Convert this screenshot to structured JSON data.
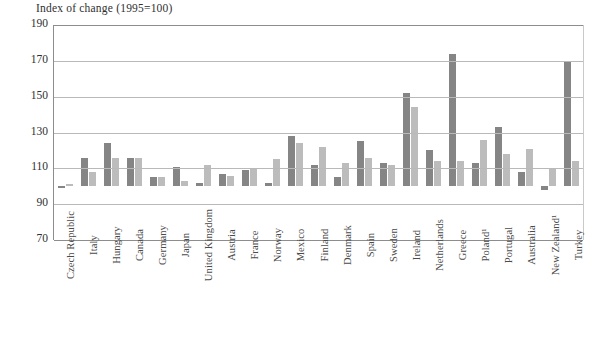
{
  "header": {
    "cropped_top_text": ""
  },
  "axis": {
    "y_title": "Index of change (1995=100)",
    "y_ticks": [
      190,
      170,
      150,
      130,
      110,
      90,
      70
    ]
  },
  "colors": {
    "series_1": "#858585",
    "series_2": "#bcbcbc",
    "gridline": "#b9b9b9",
    "axis": "#8d8d8d"
  },
  "chart_data": {
    "type": "bar",
    "title": "",
    "subtitle": "",
    "xlabel": "",
    "ylabel": "Index of change (1995=100)",
    "ylim": [
      70,
      190
    ],
    "baseline": 100,
    "grid": true,
    "legend_position": "none",
    "categories": [
      "Czech Republic",
      "Italy",
      "Hungary",
      "Canada",
      "Germany",
      "Japan",
      "United Kingdom",
      "Austria",
      "France",
      "Norway",
      "Mexico",
      "Finland",
      "Denmark",
      "Spain",
      "Sweden",
      "Ireland",
      "Netherlands",
      "Greece",
      "Poland¹",
      "Portugal",
      "Australia",
      "New Zealand¹",
      "Turkey"
    ],
    "series": [
      {
        "name": "series-1",
        "color": "#858585",
        "values": [
          100,
          116,
          124,
          116,
          105,
          111,
          102,
          107,
          109,
          102,
          128,
          112,
          105,
          125,
          113,
          152,
          120,
          174,
          113,
          133,
          108,
          98,
          170
        ]
      },
      {
        "name": "series-2",
        "color": "#bcbcbc",
        "values": [
          101,
          108,
          116,
          116,
          105,
          103,
          112,
          106,
          110,
          115,
          124,
          122,
          113,
          116,
          112,
          144,
          114,
          114,
          126,
          118,
          121,
          110,
          114
        ]
      }
    ]
  }
}
